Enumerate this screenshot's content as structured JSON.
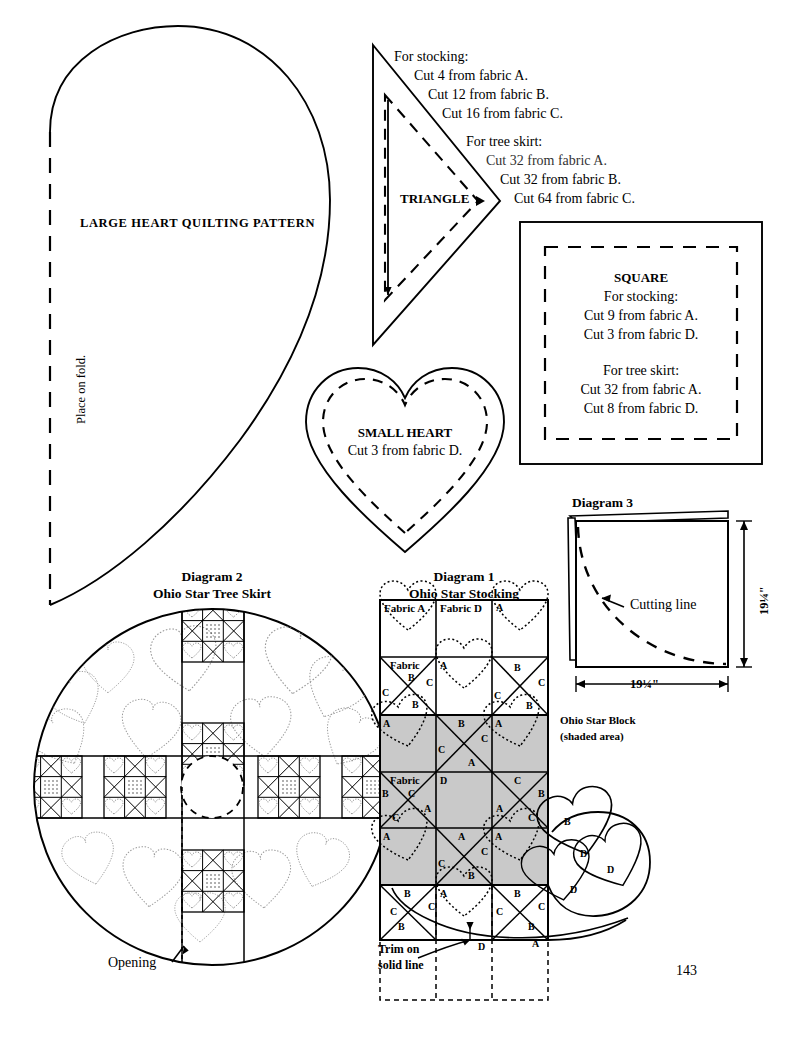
{
  "page": {
    "number": "143"
  },
  "large_heart": {
    "title": "LARGE HEART QUILTING PATTERN",
    "fold_label": "Place on fold."
  },
  "triangle": {
    "label": "TRIANGLE",
    "stocking_heading": "For stocking:",
    "stocking_lines": [
      "Cut 4 from fabric A.",
      "Cut 12 from fabric B.",
      "Cut 16 from fabric C."
    ],
    "treeskirt_heading": "For tree skirt:",
    "treeskirt_lines": [
      "Cut 32 from fabric A.",
      "Cut 32 from fabric B.",
      "Cut 64 from fabric C."
    ]
  },
  "square": {
    "label": "SQUARE",
    "stocking_heading": "For stocking:",
    "stocking_lines": [
      "Cut 9 from fabric A.",
      "Cut 3 from fabric D."
    ],
    "treeskirt_heading": "For tree skirt:",
    "treeskirt_lines": [
      "Cut 32 from fabric A.",
      "Cut 8 from fabric D."
    ]
  },
  "small_heart": {
    "label": "SMALL HEART",
    "line": "Cut 3 from fabric D."
  },
  "diagram2": {
    "title": "Diagram 2",
    "subtitle": "Ohio Star Tree Skirt",
    "opening_label": "Opening"
  },
  "diagram1": {
    "title": "Diagram 1",
    "subtitle": "Ohio Star Stocking",
    "block_label_line1": "Ohio Star Block",
    "block_label_line2": "(shaded area)",
    "trim_line1": "Trim on",
    "trim_line2": "solid line",
    "foot_hearts": [
      "D",
      "D",
      "D"
    ],
    "grid": {
      "rows": 6,
      "cols": 3,
      "shaded_rows": [
        3,
        4,
        5
      ],
      "cells": [
        {
          "r": 1,
          "c": 1,
          "type": "square-heart",
          "corner": "Fabric A",
          "shaded": false
        },
        {
          "r": 1,
          "c": 2,
          "type": "square",
          "corner": "Fabric D",
          "shaded": false
        },
        {
          "r": 1,
          "c": 3,
          "type": "square-heart",
          "corner": "A",
          "shaded": false
        },
        {
          "r": 2,
          "c": 1,
          "type": "quarter",
          "corner": "Fabric",
          "top": "B",
          "left": "C",
          "right": "C",
          "bottom": "B",
          "shaded": false
        },
        {
          "r": 2,
          "c": 2,
          "type": "square-heart",
          "corner": "A",
          "shaded": false
        },
        {
          "r": 2,
          "c": 3,
          "type": "quarter",
          "top": "B",
          "left": "C",
          "right": "C",
          "bottom": "B",
          "shaded": false
        },
        {
          "r": 3,
          "c": 1,
          "type": "square-heart",
          "corner": "A",
          "shaded": true
        },
        {
          "r": 3,
          "c": 2,
          "type": "quarter",
          "top": "B",
          "left": "C",
          "right": "C",
          "bottom": "A",
          "shaded": true
        },
        {
          "r": 3,
          "c": 3,
          "type": "square-heart",
          "corner": "A",
          "shaded": true
        },
        {
          "r": 4,
          "c": 1,
          "type": "quarter",
          "corner": "Fabric",
          "top": "C",
          "left": "B",
          "right": "A",
          "bottom": "C",
          "shaded": true
        },
        {
          "r": 4,
          "c": 2,
          "type": "square",
          "corner": "D",
          "shaded": true
        },
        {
          "r": 4,
          "c": 3,
          "type": "quarter",
          "top": "C",
          "left": "A",
          "right": "B",
          "bottom": "C",
          "shaded": true
        },
        {
          "r": 5,
          "c": 1,
          "type": "square-heart",
          "corner": "A",
          "shaded": true
        },
        {
          "r": 5,
          "c": 2,
          "type": "quarter",
          "top": "A",
          "left": "C",
          "right": "C",
          "bottom": "B",
          "shaded": true
        },
        {
          "r": 5,
          "c": 3,
          "type": "square-heart",
          "corner": "A",
          "shaded": true
        },
        {
          "r": 6,
          "c": 1,
          "type": "quarter",
          "top": "B",
          "left": "C",
          "right": "C",
          "bottom": "B",
          "shaded": false
        },
        {
          "r": 6,
          "c": 2,
          "type": "square-heart",
          "corner": "A",
          "shaded": false
        },
        {
          "r": 6,
          "c": 3,
          "type": "quarter",
          "top": "B",
          "left": "C",
          "right": "C",
          "bottom": "B",
          "shaded": false
        }
      ],
      "bottom_labels": [
        "D",
        "A"
      ]
    }
  },
  "diagram3": {
    "title": "Diagram 3",
    "cutting_line_label": "Cutting line",
    "width_dim": "19¼\"",
    "height_dim": "19¼\""
  },
  "colors": {
    "ink": "#000000",
    "shade": "#c9c9c9",
    "paper": "#ffffff",
    "faint": "#8a8a8a"
  }
}
